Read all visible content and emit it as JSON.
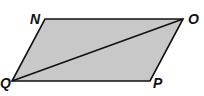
{
  "diagram": {
    "type": "parallelogram-with-diagonal",
    "fill_color": "#c8c8c8",
    "stroke_color": "#111111",
    "vertices": [
      {
        "label": "N",
        "x": 45,
        "y": 19,
        "label_x": 30,
        "label_y": 24
      },
      {
        "label": "O",
        "x": 183,
        "y": 19,
        "label_x": 188,
        "label_y": 24
      },
      {
        "label": "P",
        "x": 150,
        "y": 81,
        "label_x": 153,
        "label_y": 88
      },
      {
        "label": "Q",
        "x": 12,
        "y": 81,
        "label_x": 0,
        "label_y": 88
      }
    ],
    "diagonal": {
      "from": "Q",
      "to": "O"
    }
  }
}
